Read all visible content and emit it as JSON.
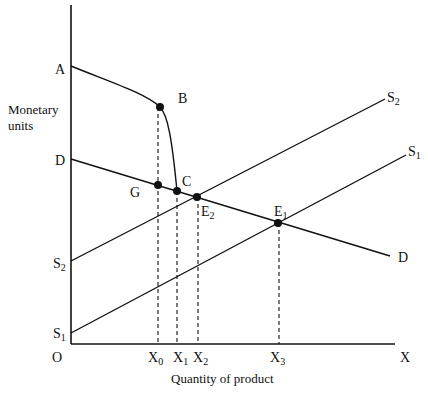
{
  "diagram": {
    "y_axis_title": [
      "Monetary",
      "units"
    ],
    "x_axis_title": "Quantity of product",
    "origin_label": "O",
    "x_axis_end_label": "X",
    "y_labels": {
      "A": "A",
      "D": "D",
      "S2": {
        "base": "S",
        "sub": "2"
      },
      "S1": {
        "base": "S",
        "sub": "1"
      }
    },
    "x_labels": [
      {
        "base": "X",
        "sub": "0"
      },
      {
        "base": "X",
        "sub": "1"
      },
      {
        "base": "X",
        "sub": "2"
      },
      {
        "base": "X",
        "sub": "3"
      }
    ],
    "curve_labels": {
      "S2_end": {
        "base": "S",
        "sub": "2"
      },
      "S1_end": {
        "base": "S",
        "sub": "1"
      },
      "D_end": "D"
    },
    "points": {
      "B": "B",
      "C": "C",
      "G": "G",
      "E2": {
        "base": "E",
        "sub": "2"
      },
      "E1": {
        "base": "E",
        "sub": "1"
      }
    },
    "colors": {
      "line": "#111111",
      "background": "#ffffff"
    }
  }
}
